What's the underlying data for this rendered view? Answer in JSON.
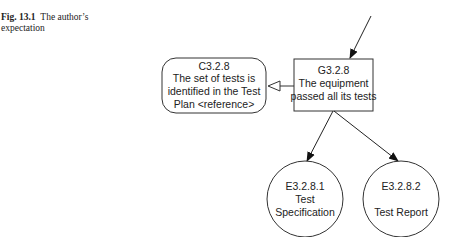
{
  "figure": {
    "label": "Fig. 13.1",
    "caption": "The author’s expectation"
  },
  "diagram": {
    "goal": {
      "id": "G3.2.8",
      "lines": [
        "G3.2.8",
        "The equipment",
        "passed all its tests"
      ]
    },
    "context": {
      "id": "C3.2.8",
      "lines": [
        "C3.2.8",
        "The set of tests is",
        "identified in the Test",
        "Plan <reference>"
      ]
    },
    "evidence": [
      {
        "id": "E3.2.8.1",
        "lines": [
          "E3.2.8.1",
          "Test",
          "Specification"
        ]
      },
      {
        "id": "E3.2.8.2",
        "lines": [
          "E3.2.8.2",
          "",
          "Test Report"
        ]
      }
    ],
    "colors": {
      "stroke": "#333333",
      "text": "#222222"
    }
  }
}
